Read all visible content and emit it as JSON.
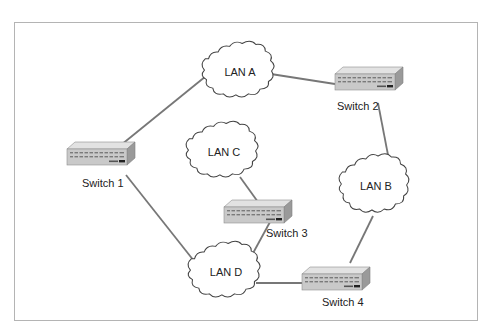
{
  "diagram": {
    "type": "network-topology",
    "colors": {
      "frame": "#b4b4b4",
      "link": "#777777",
      "cloud_stroke": "#444444",
      "switch_front": "#c9c9c9",
      "switch_top": "#e2e2e2",
      "switch_side": "#9a9a9a"
    },
    "lans": [
      {
        "id": "lanA",
        "label": "LAN A",
        "cx": 240,
        "cy": 72
      },
      {
        "id": "lanB",
        "label": "LAN B",
        "cx": 375,
        "cy": 186
      },
      {
        "id": "lanC",
        "label": "LAN C",
        "cx": 222,
        "cy": 152
      },
      {
        "id": "lanD",
        "label": "LAN D",
        "cx": 226,
        "cy": 270
      }
    ],
    "switches": [
      {
        "id": "sw1",
        "label": "Switch 1",
        "x": 67,
        "y": 150
      },
      {
        "id": "sw2",
        "label": "Switch 2",
        "x": 335,
        "y": 76
      },
      {
        "id": "sw3",
        "label": "Switch 3",
        "x": 222,
        "y": 206
      },
      {
        "id": "sw4",
        "label": "Switch 4",
        "x": 302,
        "y": 270
      }
    ],
    "links": [
      {
        "from": "Switch 1",
        "to": "LAN A"
      },
      {
        "from": "Switch 1",
        "to": "LAN D"
      },
      {
        "from": "LAN A",
        "to": "Switch 2"
      },
      {
        "from": "Switch 2",
        "to": "LAN B"
      },
      {
        "from": "LAN B",
        "to": "Switch 4"
      },
      {
        "from": "LAN C",
        "to": "Switch 3"
      },
      {
        "from": "Switch 3",
        "to": "LAN D"
      },
      {
        "from": "LAN D",
        "to": "Switch 4"
      }
    ]
  }
}
